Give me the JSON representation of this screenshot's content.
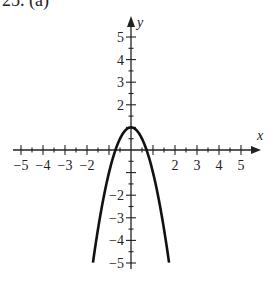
{
  "problem": {
    "label": "25.  (a)"
  },
  "chart_data": {
    "type": "line",
    "title": "",
    "function": "y = 1 - 2x^2",
    "xlabel": "x",
    "ylabel": "y",
    "xlim": [
      -5,
      5
    ],
    "ylim": [
      -5,
      5
    ],
    "grid": false,
    "x_tick_labels": [
      "-5",
      "-4",
      "-3",
      "-2",
      "2",
      "3",
      "4",
      "5"
    ],
    "y_tick_labels": [
      "5",
      "4",
      "3",
      "2",
      "-2",
      "-3",
      "-4",
      "-5"
    ],
    "minor_ticks": 0.5,
    "series": [
      {
        "name": "parabola",
        "x": [
          -1.73,
          -1.5,
          -1.25,
          -1.0,
          -0.75,
          -0.5,
          -0.25,
          0,
          0.25,
          0.5,
          0.75,
          1.0,
          1.25,
          1.5,
          1.73
        ],
        "y": [
          -5.0,
          -3.5,
          -2.125,
          -1.0,
          -0.125,
          0.5,
          0.875,
          1.0,
          0.875,
          0.5,
          -0.125,
          -1.0,
          -2.125,
          -3.5,
          -5.0
        ]
      }
    ],
    "vertex": [
      0,
      1
    ],
    "x_intercepts": [
      -0.71,
      0.71
    ],
    "color": "#111111"
  }
}
